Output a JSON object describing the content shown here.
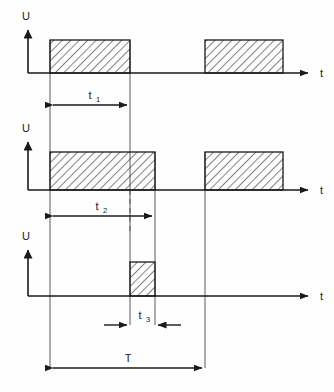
{
  "diagram": {
    "type": "timing-waveform",
    "background_color": "#fefefe",
    "line_color": "#1a1a1a",
    "hatch_color": "#1a1a1a"
  },
  "axes": {
    "vertical_label": "U",
    "horizontal_label": "t"
  },
  "traces": [
    {
      "id": "trace-1",
      "vertical_axis_label": "U",
      "horizontal_axis_label": "t",
      "baseline_y": 73,
      "pulse_top_y": 40,
      "axis_x": 28,
      "axis_top_y": 28,
      "axis_end_x": 312,
      "pulses": [
        {
          "start_x": 50,
          "end_x": 130
        },
        {
          "start_x": 205,
          "end_x": 283
        }
      ]
    },
    {
      "id": "trace-2",
      "vertical_axis_label": "U",
      "horizontal_axis_label": "t",
      "baseline_y": 190,
      "pulse_top_y": 152,
      "axis_x": 28,
      "axis_top_y": 140,
      "axis_end_x": 312,
      "pulses": [
        {
          "start_x": 50,
          "end_x": 155
        },
        {
          "start_x": 205,
          "end_x": 283
        }
      ]
    },
    {
      "id": "trace-3",
      "vertical_axis_label": "U",
      "horizontal_axis_label": "t",
      "baseline_y": 296,
      "pulse_top_y": 262,
      "axis_x": 28,
      "axis_top_y": 248,
      "axis_end_x": 312,
      "pulses": [
        {
          "start_x": 130,
          "end_x": 155
        }
      ]
    }
  ],
  "dimensions": [
    {
      "id": "dim-t1",
      "label": "t",
      "subscript": "1",
      "start_x": 50,
      "end_x": 130,
      "y": 105,
      "label_x": 90,
      "label_y": 98,
      "arrows": "inward"
    },
    {
      "id": "dim-t2",
      "label": "t",
      "subscript": "2",
      "start_x": 50,
      "end_x": 155,
      "y": 216,
      "label_x": 97,
      "label_y": 209,
      "arrows": "inward"
    },
    {
      "id": "dim-t3",
      "label": "t",
      "subscript": "3",
      "start_x": 130,
      "end_x": 155,
      "y": 325,
      "label_x": 142,
      "label_y": 318,
      "arrows": "outward"
    },
    {
      "id": "dim-T",
      "label": "T",
      "subscript": "",
      "start_x": 50,
      "end_x": 205,
      "y": 368,
      "label_x": 128,
      "label_y": 361,
      "arrows": "inward"
    }
  ],
  "construction_lines": [
    {
      "id": "cl-left",
      "x": 50,
      "top_y": 40,
      "bottom_y": 368,
      "style": "solid"
    },
    {
      "id": "cl-t1-right",
      "x": 130,
      "top_y": 40,
      "bottom_y": 325,
      "style": "solid"
    },
    {
      "id": "cl-t2-right",
      "x": 155,
      "top_y": 152,
      "bottom_y": 325,
      "style": "solid"
    },
    {
      "id": "cl-t2-dashed",
      "x": 130,
      "top_y": 190,
      "bottom_y": 230,
      "style": "dashed"
    },
    {
      "id": "cl-period-right",
      "x": 205,
      "top_y": 152,
      "bottom_y": 368,
      "style": "solid"
    }
  ]
}
